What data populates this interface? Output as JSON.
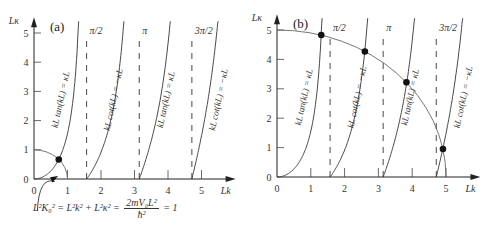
{
  "equation": {
    "lhs": "L²K₀² = L²k² + L²κ² =",
    "numerator": "2mV₀L²",
    "denominator": "ħ²",
    "rhs": "= 1"
  },
  "chart_data": [
    {
      "type": "line",
      "panel_label": "(a)",
      "xlabel": "Lk",
      "ylabel": "Lκ",
      "xticks": [
        "0",
        "1",
        "2",
        "3",
        "4",
        "5"
      ],
      "yticks": [
        "0",
        "1",
        "2",
        "3",
        "4",
        "5"
      ],
      "xlim": [
        0,
        5.9
      ],
      "ylim": [
        0,
        5.4
      ],
      "asymptotes": [
        {
          "x": 1.5708,
          "label": "π/2"
        },
        {
          "x": 3.1416,
          "label": "π"
        },
        {
          "x": 4.7124,
          "label": "3π/2"
        }
      ],
      "curves": [
        {
          "name": "kL tan(kL) = κL",
          "type": "tan",
          "x_start": 0
        },
        {
          "name": "kL cot(kL) = −κL",
          "type": "cot",
          "x_start": 1.5708
        },
        {
          "name": "kL tan(kL) = κL",
          "type": "tan",
          "x_start": 3.1416
        },
        {
          "name": "kL cot(kL) = −κL",
          "type": "cot",
          "x_start": 4.7124
        }
      ],
      "circle_radius": 1,
      "intersections": [
        {
          "x": 0.74,
          "y": 0.67
        }
      ]
    },
    {
      "type": "line",
      "panel_label": "(b)",
      "xlabel": "Lk",
      "ylabel": "Lκ",
      "xticks": [
        "0",
        "1",
        "2",
        "3",
        "4",
        "5"
      ],
      "yticks": [
        "0",
        "1",
        "2",
        "3",
        "4",
        "5"
      ],
      "xlim": [
        0,
        5.9
      ],
      "ylim": [
        0,
        5.4
      ],
      "asymptotes": [
        {
          "x": 1.5708,
          "label": "π/2"
        },
        {
          "x": 3.1416,
          "label": "π"
        },
        {
          "x": 4.7124,
          "label": "3π/2"
        }
      ],
      "curves": [
        {
          "name": "kL tan(kL) = κL",
          "type": "tan",
          "x_start": 0
        },
        {
          "name": "kL cot(kL) = −κL",
          "type": "cot",
          "x_start": 1.5708
        },
        {
          "name": "kL tan(kL) = κL",
          "type": "tan",
          "x_start": 3.1416
        },
        {
          "name": "kL cot(kL) = −κL",
          "type": "cot",
          "x_start": 4.7124
        }
      ],
      "circle_radius": 5,
      "intersections": [
        {
          "x": 1.31,
          "y": 4.83
        },
        {
          "x": 2.6,
          "y": 4.27
        },
        {
          "x": 3.83,
          "y": 3.22
        },
        {
          "x": 4.91,
          "y": 0.95
        }
      ]
    }
  ],
  "layout": {
    "panels": [
      {
        "ox": 34,
        "oy": 179,
        "sx": 33.5,
        "sy": 29.2
      },
      {
        "ox": 277,
        "oy": 177,
        "sx": 33.8,
        "sy": 29.4
      }
    ]
  }
}
